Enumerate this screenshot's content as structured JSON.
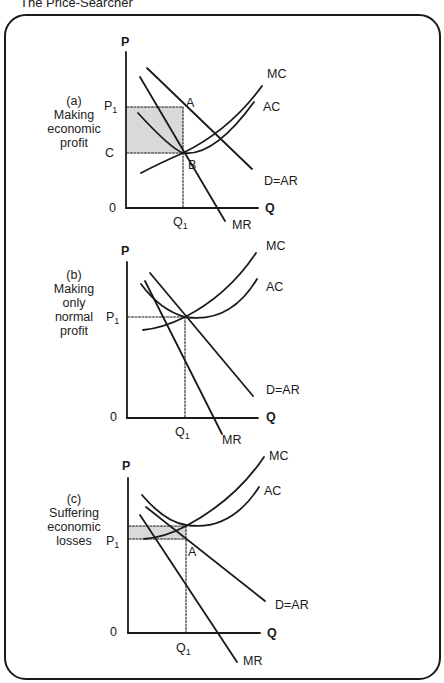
{
  "title": "The Price-Searcher",
  "panels": [
    {
      "id": "a",
      "label_letter": "(a)",
      "label_lines": [
        "Making",
        "economic",
        "profit"
      ],
      "axis_y": "P",
      "axis_x": "Q",
      "origin": "0",
      "price_label": "P",
      "price_sub": "1",
      "cost_label": "C",
      "q_label": "Q",
      "q_sub": "1",
      "point_a": "A",
      "point_b": "B",
      "curves": {
        "mc": "MC",
        "ac": "AC",
        "demand": "D=AR",
        "mr": "MR"
      },
      "shaded_region": "economic profit"
    },
    {
      "id": "b",
      "label_letter": "(b)",
      "label_lines": [
        "Making",
        "only",
        "normal",
        "profit"
      ],
      "axis_y": "P",
      "axis_x": "Q",
      "origin": "0",
      "price_label": "P",
      "price_sub": "1",
      "q_label": "Q",
      "q_sub": "1",
      "curves": {
        "mc": "MC",
        "ac": "AC",
        "demand": "D=AR",
        "mr": "MR"
      }
    },
    {
      "id": "c",
      "label_letter": "(c)",
      "label_lines": [
        "Suffering",
        "economic",
        "losses"
      ],
      "axis_y": "P",
      "axis_x": "Q",
      "origin": "0",
      "price_label": "P",
      "price_sub": "1",
      "q_label": "Q",
      "q_sub": "1",
      "point_a": "A",
      "curves": {
        "mc": "MC",
        "ac": "AC",
        "demand": "D=AR",
        "mr": "MR"
      },
      "shaded_region": "economic loss"
    }
  ],
  "colors": {
    "line": "#1a1a1a",
    "shade": "#d9d9d9",
    "frame": "#1a1a1a"
  }
}
